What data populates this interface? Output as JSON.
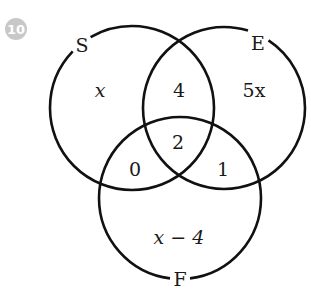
{
  "question_number": "10",
  "badge_color": "#c8c8c8",
  "sets": [
    {
      "label": "S",
      "cx": 132,
      "cy": 108,
      "r": 82
    },
    {
      "label": "E",
      "cx": 224,
      "cy": 108,
      "r": 81
    },
    {
      "label": "F",
      "cx": 180,
      "cy": 198,
      "r": 81
    }
  ],
  "regions": {
    "s_only": "x",
    "e_only": "5x",
    "f_only": "x − 4",
    "s_and_e": "4",
    "s_and_f": "0",
    "e_and_f": "1",
    "all_three": "2"
  }
}
